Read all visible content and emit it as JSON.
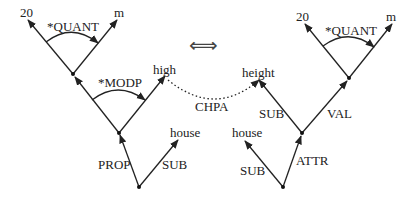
{
  "diagram": {
    "left": {
      "nodes": {
        "n20": "20",
        "m": "m",
        "high": "high",
        "house": "house"
      },
      "edges": {
        "quant": "*QUANT",
        "modp": "*MODP",
        "prop": "PROP",
        "sub": "SUB"
      }
    },
    "right": {
      "nodes": {
        "n20": "20",
        "m": "m",
        "height": "height",
        "house": "house"
      },
      "edges": {
        "quant": "*QUANT",
        "sub_upper": "SUB",
        "val": "VAL",
        "sub_lower": "SUB",
        "attr": "ATTR"
      }
    },
    "link": {
      "label": "CHPA"
    },
    "equivalence_symbol": "⟺"
  }
}
